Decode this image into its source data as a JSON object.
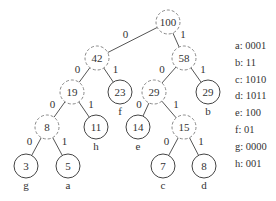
{
  "diagram": {
    "nodes": [
      {
        "id": "n100",
        "value": "100",
        "x": 168,
        "y": 22,
        "type": "internal"
      },
      {
        "id": "n42",
        "value": "42",
        "x": 97,
        "y": 58,
        "type": "internal"
      },
      {
        "id": "n58",
        "value": "58",
        "x": 184,
        "y": 58,
        "type": "internal"
      },
      {
        "id": "n19",
        "value": "19",
        "x": 72,
        "y": 92,
        "type": "internal"
      },
      {
        "id": "n23",
        "value": "23",
        "x": 120,
        "y": 92,
        "type": "leaf",
        "symbol": "f"
      },
      {
        "id": "n29a",
        "value": "29",
        "x": 154,
        "y": 92,
        "type": "internal"
      },
      {
        "id": "n29b",
        "value": "29",
        "x": 208,
        "y": 92,
        "type": "leaf",
        "symbol": "b"
      },
      {
        "id": "n8a",
        "value": "8",
        "x": 47,
        "y": 127,
        "type": "internal"
      },
      {
        "id": "n11",
        "value": "11",
        "x": 96,
        "y": 127,
        "type": "leaf",
        "symbol": "h"
      },
      {
        "id": "n14",
        "value": "14",
        "x": 138,
        "y": 127,
        "type": "leaf",
        "symbol": "e"
      },
      {
        "id": "n15",
        "value": "15",
        "x": 184,
        "y": 127,
        "type": "internal"
      },
      {
        "id": "n3",
        "value": "3",
        "x": 26,
        "y": 166,
        "type": "leaf",
        "symbol": "g"
      },
      {
        "id": "n5",
        "value": "5",
        "x": 68,
        "y": 166,
        "type": "leaf",
        "symbol": "a"
      },
      {
        "id": "n7",
        "value": "7",
        "x": 163,
        "y": 166,
        "type": "leaf",
        "symbol": "c"
      },
      {
        "id": "n8b",
        "value": "8",
        "x": 204,
        "y": 166,
        "type": "leaf",
        "symbol": "d"
      }
    ],
    "edges": [
      {
        "from": "n100",
        "to": "n42",
        "label": "0"
      },
      {
        "from": "n100",
        "to": "n58",
        "label": "1"
      },
      {
        "from": "n42",
        "to": "n19",
        "label": "0"
      },
      {
        "from": "n42",
        "to": "n23",
        "label": "1"
      },
      {
        "from": "n58",
        "to": "n29a",
        "label": "0"
      },
      {
        "from": "n58",
        "to": "n29b",
        "label": "1"
      },
      {
        "from": "n19",
        "to": "n8a",
        "label": "0"
      },
      {
        "from": "n19",
        "to": "n11",
        "label": "1"
      },
      {
        "from": "n29a",
        "to": "n14",
        "label": "0"
      },
      {
        "from": "n29a",
        "to": "n15",
        "label": "1"
      },
      {
        "from": "n8a",
        "to": "n3",
        "label": "0"
      },
      {
        "from": "n8a",
        "to": "n5",
        "label": "1"
      },
      {
        "from": "n15",
        "to": "n7",
        "label": "0"
      },
      {
        "from": "n15",
        "to": "n8b",
        "label": "1"
      }
    ],
    "legend": [
      "a: 0001",
      "b: 11",
      "c: 1010",
      "d: 1011",
      "e: 100",
      "f: 01",
      "g: 0000",
      "h: 001"
    ]
  }
}
